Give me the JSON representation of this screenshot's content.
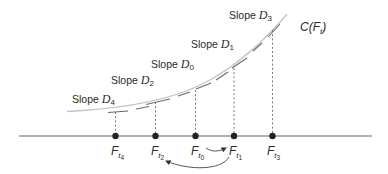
{
  "diagram": {
    "curve_label": {
      "prefix": "C(",
      "var": "F",
      "sub": "t",
      "suffix": ")"
    },
    "slope_word": "Slope",
    "slope_labels": [
      {
        "id": "D4",
        "var": "D",
        "sub": "4"
      },
      {
        "id": "D2",
        "var": "D",
        "sub": "2"
      },
      {
        "id": "D0",
        "var": "D",
        "sub": "0"
      },
      {
        "id": "D1",
        "var": "D",
        "sub": "1"
      },
      {
        "id": "D3",
        "var": "D",
        "sub": "3"
      }
    ],
    "axis_points": [
      {
        "id": "Ft4",
        "var": "F",
        "sub": "t",
        "subsub": "4",
        "x": 115.5
      },
      {
        "id": "Ft2",
        "var": "F",
        "sub": "t",
        "subsub": "2",
        "x": 155.5
      },
      {
        "id": "Ft0",
        "var": "F",
        "sub": "t",
        "subsub": "0",
        "x": 195.5
      },
      {
        "id": "Ft1",
        "var": "F",
        "sub": "t",
        "subsub": "1",
        "x": 234
      },
      {
        "id": "Ft3",
        "var": "F",
        "sub": "t",
        "subsub": "3",
        "x": 272.5
      }
    ],
    "arrows": [
      {
        "from": "Ft0",
        "to": "Ft1"
      },
      {
        "from": "Ft1",
        "to": "Ft2"
      }
    ],
    "colors": {
      "curve": "#bdbdbd",
      "tangent": "#6e6e6e",
      "axis": "#555555",
      "dot": "#222222",
      "text": "#2a2a2a"
    }
  }
}
